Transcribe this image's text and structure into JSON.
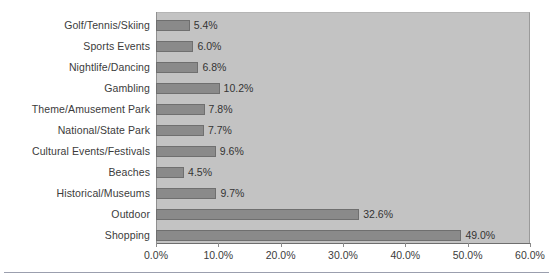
{
  "chart_data": {
    "type": "bar",
    "orientation": "horizontal",
    "title": "",
    "xlabel": "",
    "ylabel": "",
    "xlim": [
      0,
      60
    ],
    "grid": false,
    "legend": null,
    "xticks": [
      "0.0%",
      "10.0%",
      "20.0%",
      "30.0%",
      "40.0%",
      "50.0%",
      "60.0%"
    ],
    "xtick_values": [
      0,
      10,
      20,
      30,
      40,
      50,
      60
    ],
    "categories": [
      "Golf/Tennis/Skiing",
      "Sports Events",
      "Nightlife/Dancing",
      "Gambling",
      "Theme/Amusement Park",
      "National/State Park",
      "Cultural Events/Festivals",
      "Beaches",
      "Historical/Museums",
      "Outdoor",
      "Shopping"
    ],
    "values": [
      5.4,
      6.0,
      6.8,
      10.2,
      7.8,
      7.7,
      9.6,
      4.5,
      9.7,
      32.6,
      49.0
    ],
    "data_labels": [
      "5.4%",
      "6.0%",
      "6.8%",
      "10.2%",
      "7.8%",
      "7.7%",
      "9.6%",
      "4.5%",
      "9.7%",
      "32.6%",
      "49.0%"
    ]
  },
  "colors": {
    "bar_fill": "#8a8a8a",
    "bar_stroke": "#6f6f6f",
    "plot_background": "#c3c3c3",
    "page_background": "#ffffff",
    "text": "#3b3b3b",
    "axis": "#8a8a8a",
    "rule": "#9b9fae"
  }
}
